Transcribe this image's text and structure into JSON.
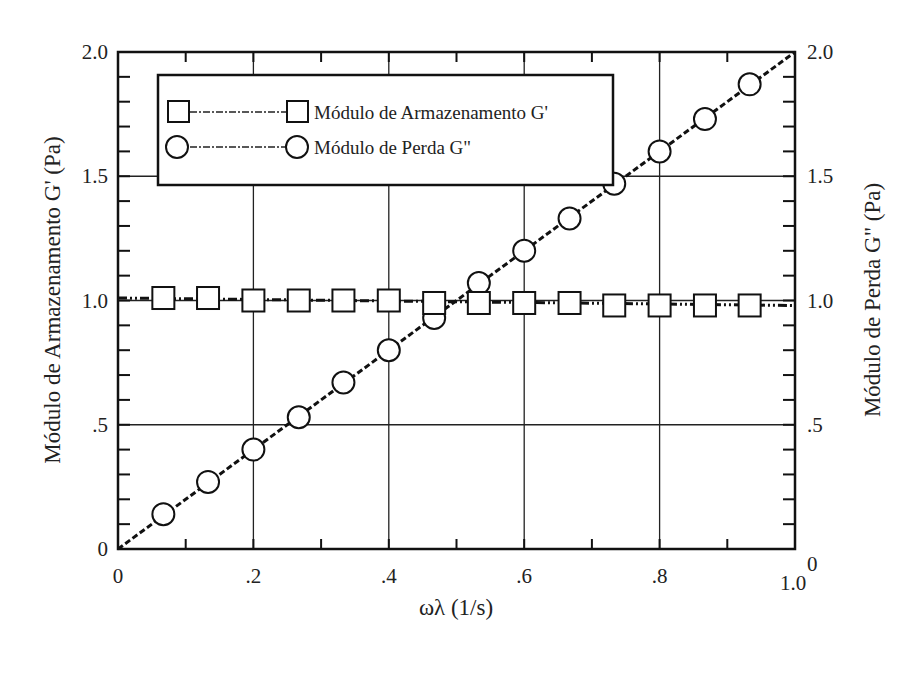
{
  "chart_data": {
    "type": "line",
    "title": "",
    "xlabel": "ωλ (1/s)",
    "ylabel_left": "Módulo de Armazenamento G' (Pa)",
    "ylabel_right": "Módulo de Perda G\" (Pa)",
    "xlim": [
      0,
      1.0
    ],
    "ylim_left": [
      0,
      2.0
    ],
    "ylim_right": [
      0,
      2.0
    ],
    "x_ticks": [
      "0",
      ".2",
      ".4",
      ".6",
      ".8",
      "1.0"
    ],
    "y_ticks_left": [
      "0",
      ".5",
      "1.0",
      "1.5",
      "2.0"
    ],
    "y_ticks_right": [
      "0",
      ".5",
      "1.0",
      "1.5",
      "2.0"
    ],
    "grid": true,
    "legend_position": "upper left",
    "series": [
      {
        "name": "Módulo de Armazenamento G'",
        "marker": "square",
        "line": "dash-dot-dot",
        "axis": "left",
        "x": [
          0.067,
          0.133,
          0.2,
          0.267,
          0.333,
          0.4,
          0.467,
          0.533,
          0.6,
          0.667,
          0.733,
          0.8,
          0.867,
          0.933
        ],
        "values": [
          1.01,
          1.01,
          1.0,
          1.0,
          1.0,
          1.0,
          0.99,
          0.99,
          0.99,
          0.99,
          0.98,
          0.98,
          0.98,
          0.98
        ]
      },
      {
        "name": "Módulo de Perda G\"",
        "marker": "circle",
        "line": "dashed",
        "axis": "right",
        "x": [
          0.067,
          0.133,
          0.2,
          0.267,
          0.333,
          0.4,
          0.467,
          0.533,
          0.6,
          0.667,
          0.733,
          0.8,
          0.867,
          0.933
        ],
        "values": [
          0.14,
          0.27,
          0.4,
          0.53,
          0.67,
          0.8,
          0.93,
          1.07,
          1.2,
          1.33,
          1.47,
          1.6,
          1.73,
          1.87
        ]
      }
    ]
  }
}
